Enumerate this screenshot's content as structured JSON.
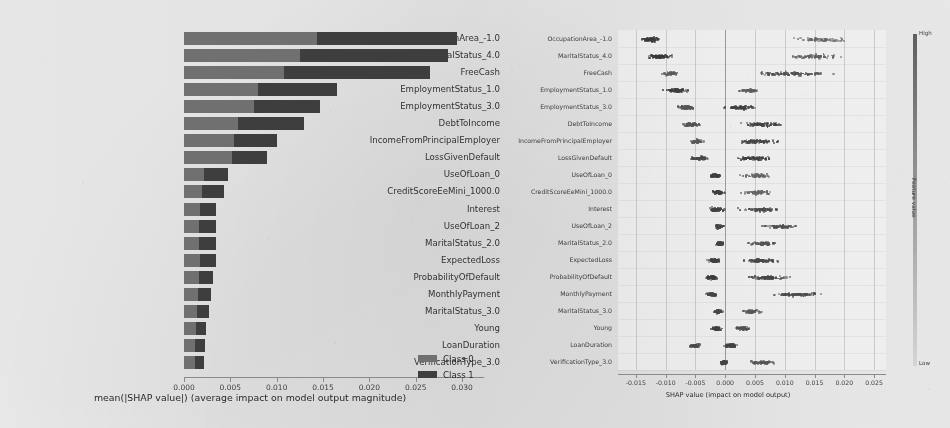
{
  "figure": {
    "kind": "shap-explanation-figure",
    "background_hex": "#f2f1ee"
  },
  "left_chart": {
    "xlabel": "mean(|SHAP value|) (average impact on model output magnitude)",
    "legend": [
      {
        "label": "Class 0",
        "color": "#6f6f6f"
      },
      {
        "label": "Class 1",
        "color": "#3b3b3b"
      }
    ],
    "xticks": [
      "0.000",
      "0.005",
      "0.010",
      "0.015",
      "0.020",
      "0.025",
      "0.030"
    ]
  },
  "right_chart": {
    "xlabel": "SHAP value (impact on model output)",
    "xticks": [
      "-0.015",
      "-0.010",
      "-0.005",
      "0.000",
      "0.005",
      "0.010",
      "0.015",
      "0.020",
      "0.025"
    ],
    "colorbar": {
      "high_label": "High",
      "low_label": "Low",
      "title": "Feature value"
    }
  },
  "chart_data": [
    {
      "type": "bar",
      "orientation": "horizontal",
      "stacked": true,
      "title": "",
      "xlabel": "mean(|SHAP value|) (average impact on model output magnitude)",
      "ylabel": "",
      "xlim": [
        0,
        0.0315
      ],
      "grid": false,
      "legend_position": "lower-right",
      "categories": [
        "OccupationArea_-1.0",
        "MaritalStatus_4.0",
        "FreeCash",
        "EmploymentStatus_1.0",
        "EmploymentStatus_3.0",
        "DebtToIncome",
        "IncomeFromPrincipalEmployer",
        "LossGivenDefault",
        "UseOfLoan_0",
        "CreditScoreEeMini_1000.0",
        "Interest",
        "UseOfLoan_2",
        "MaritalStatus_2.0",
        "ExpectedLoss",
        "ProbabilityOfDefault",
        "MonthlyPayment",
        "MaritalStatus_3.0",
        "Young",
        "LoanDuration",
        "VerificationType_3.0"
      ],
      "series": [
        {
          "name": "Class 0",
          "color": "#6f6f6f",
          "values": [
            0.0143,
            0.0125,
            0.0108,
            0.008,
            0.0075,
            0.0058,
            0.0054,
            0.0052,
            0.0022,
            0.0019,
            0.0017,
            0.0016,
            0.0016,
            0.0017,
            0.0016,
            0.0015,
            0.0014,
            0.0013,
            0.0012,
            0.0012
          ]
        },
        {
          "name": "Class 1",
          "color": "#3b3b3b",
          "values": [
            0.0152,
            0.016,
            0.0157,
            0.0085,
            0.0072,
            0.0072,
            0.0046,
            0.0038,
            0.0025,
            0.0024,
            0.0018,
            0.0019,
            0.0019,
            0.0017,
            0.0015,
            0.0014,
            0.0013,
            0.0011,
            0.0011,
            0.001
          ]
        }
      ],
      "totals": [
        0.0295,
        0.0285,
        0.0265,
        0.0165,
        0.0147,
        0.013,
        0.01,
        0.009,
        0.0047,
        0.0043,
        0.0035,
        0.0035,
        0.0035,
        0.0034,
        0.0031,
        0.0029,
        0.0027,
        0.0024,
        0.0023,
        0.0022
      ]
    },
    {
      "type": "scatter",
      "variant": "beeswarm",
      "title": "",
      "xlabel": "SHAP value (impact on model output)",
      "ylabel": "",
      "xlim": [
        -0.018,
        0.027
      ],
      "grid": true,
      "legend_position": "right-colorbar",
      "categories": [
        "OccupationArea_-1.0",
        "MaritalStatus_4.0",
        "FreeCash",
        "EmploymentStatus_1.0",
        "EmploymentStatus_3.0",
        "DebtToIncome",
        "IncomeFromPrincipalEmployer",
        "LossGivenDefault",
        "UseOfLoan_0",
        "CreditScoreEeMini_1000.0",
        "Interest",
        "UseOfLoan_2",
        "MaritalStatus_2.0",
        "ExpectedLoss",
        "ProbabilityOfDefault",
        "MonthlyPayment",
        "MaritalStatus_3.0",
        "Young",
        "LoanDuration",
        "VerificationType_3.0"
      ],
      "rows": [
        {
          "feature": "OccupationArea_-1.0",
          "clusters": [
            {
              "center": -0.0128,
              "spread": 0.0016,
              "weight": 0.55,
              "shade": 0.22
            },
            {
              "center": 0.0158,
              "spread": 0.0042,
              "weight": 0.45,
              "shade": 0.55
            }
          ]
        },
        {
          "feature": "MaritalStatus_4.0",
          "clusters": [
            {
              "center": -0.0112,
              "spread": 0.002,
              "weight": 0.55,
              "shade": 0.2
            },
            {
              "center": 0.0152,
              "spread": 0.0045,
              "weight": 0.45,
              "shade": 0.5
            }
          ]
        },
        {
          "feature": "FreeCash",
          "clusters": [
            {
              "center": -0.0092,
              "spread": 0.0014,
              "weight": 0.3,
              "shade": 0.45
            },
            {
              "center": 0.0105,
              "spread": 0.007,
              "weight": 0.7,
              "shade": 0.38
            }
          ]
        },
        {
          "feature": "EmploymentStatus_1.0",
          "clusters": [
            {
              "center": -0.0085,
              "spread": 0.0018,
              "weight": 0.6,
              "shade": 0.25
            },
            {
              "center": 0.004,
              "spread": 0.0016,
              "weight": 0.4,
              "shade": 0.48
            }
          ]
        },
        {
          "feature": "EmploymentStatus_3.0",
          "clusters": [
            {
              "center": -0.0068,
              "spread": 0.0014,
              "weight": 0.55,
              "shade": 0.42
            },
            {
              "center": 0.0022,
              "spread": 0.0024,
              "weight": 0.45,
              "shade": 0.26
            }
          ]
        },
        {
          "feature": "DebtToIncome",
          "clusters": [
            {
              "center": -0.0058,
              "spread": 0.0015,
              "weight": 0.45,
              "shade": 0.4
            },
            {
              "center": 0.0062,
              "spread": 0.0034,
              "weight": 0.55,
              "shade": 0.28
            }
          ]
        },
        {
          "feature": "IncomeFromPrincipalEmployer",
          "clusters": [
            {
              "center": -0.0052,
              "spread": 0.0012,
              "weight": 0.42,
              "shade": 0.44
            },
            {
              "center": 0.0052,
              "spread": 0.0038,
              "weight": 0.58,
              "shade": 0.3
            }
          ]
        },
        {
          "feature": "LossGivenDefault",
          "clusters": [
            {
              "center": -0.0046,
              "spread": 0.0018,
              "weight": 0.48,
              "shade": 0.32
            },
            {
              "center": 0.0046,
              "spread": 0.003,
              "weight": 0.52,
              "shade": 0.26
            }
          ]
        },
        {
          "feature": "UseOfLoan_0",
          "clusters": [
            {
              "center": -0.0018,
              "spread": 0.0008,
              "weight": 0.55,
              "shade": 0.24
            },
            {
              "center": 0.0052,
              "spread": 0.0028,
              "weight": 0.45,
              "shade": 0.52
            }
          ]
        },
        {
          "feature": "CreditScoreEeMini_1000.0",
          "clusters": [
            {
              "center": -0.0014,
              "spread": 0.001,
              "weight": 0.55,
              "shade": 0.26
            },
            {
              "center": 0.0054,
              "spread": 0.0026,
              "weight": 0.45,
              "shade": 0.54
            }
          ]
        },
        {
          "feature": "Interest",
          "clusters": [
            {
              "center": -0.0016,
              "spread": 0.0012,
              "weight": 0.5,
              "shade": 0.28
            },
            {
              "center": 0.0058,
              "spread": 0.004,
              "weight": 0.5,
              "shade": 0.34
            }
          ]
        },
        {
          "feature": "UseOfLoan_2",
          "clusters": [
            {
              "center": -0.0012,
              "spread": 0.0007,
              "weight": 0.62,
              "shade": 0.3
            },
            {
              "center": 0.0092,
              "spread": 0.003,
              "weight": 0.38,
              "shade": 0.36
            }
          ]
        },
        {
          "feature": "MaritalStatus_2.0",
          "clusters": [
            {
              "center": -0.0011,
              "spread": 0.0007,
              "weight": 0.6,
              "shade": 0.28
            },
            {
              "center": 0.0062,
              "spread": 0.0022,
              "weight": 0.4,
              "shade": 0.4
            }
          ]
        },
        {
          "feature": "ExpectedLoss",
          "clusters": [
            {
              "center": -0.002,
              "spread": 0.0012,
              "weight": 0.5,
              "shade": 0.26
            },
            {
              "center": 0.0058,
              "spread": 0.0036,
              "weight": 0.5,
              "shade": 0.32
            }
          ]
        },
        {
          "feature": "ProbabilityOfDefault",
          "clusters": [
            {
              "center": -0.0024,
              "spread": 0.0011,
              "weight": 0.48,
              "shade": 0.24
            },
            {
              "center": 0.0068,
              "spread": 0.0034,
              "weight": 0.52,
              "shade": 0.3
            }
          ]
        },
        {
          "feature": "MonthlyPayment",
          "clusters": [
            {
              "center": -0.0026,
              "spread": 0.001,
              "weight": 0.45,
              "shade": 0.3
            },
            {
              "center": 0.0118,
              "spread": 0.004,
              "weight": 0.55,
              "shade": 0.34
            }
          ]
        },
        {
          "feature": "MaritalStatus_3.0",
          "clusters": [
            {
              "center": -0.0013,
              "spread": 0.0008,
              "weight": 0.58,
              "shade": 0.32
            },
            {
              "center": 0.0042,
              "spread": 0.0018,
              "weight": 0.42,
              "shade": 0.44
            }
          ]
        },
        {
          "feature": "Young",
          "clusters": [
            {
              "center": -0.0016,
              "spread": 0.0009,
              "weight": 0.58,
              "shade": 0.26
            },
            {
              "center": 0.0028,
              "spread": 0.0014,
              "weight": 0.42,
              "shade": 0.38
            }
          ]
        },
        {
          "feature": "LoanDuration",
          "clusters": [
            {
              "center": -0.0052,
              "spread": 0.001,
              "weight": 0.4,
              "shade": 0.34
            },
            {
              "center": 0.0008,
              "spread": 0.0012,
              "weight": 0.6,
              "shade": 0.28
            }
          ]
        },
        {
          "feature": "VerificationType_3.0",
          "clusters": [
            {
              "center": -0.0004,
              "spread": 0.0006,
              "weight": 0.62,
              "shade": 0.3
            },
            {
              "center": 0.006,
              "spread": 0.0022,
              "weight": 0.38,
              "shade": 0.42
            }
          ]
        }
      ]
    }
  ]
}
